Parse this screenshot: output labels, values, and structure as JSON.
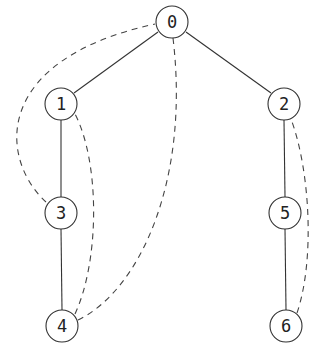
{
  "diagram": {
    "type": "tree-with-back-edges",
    "nodes": [
      {
        "id": "0",
        "label": "0",
        "x": 172,
        "y": 22
      },
      {
        "id": "1",
        "label": "1",
        "x": 61,
        "y": 104
      },
      {
        "id": "2",
        "label": "2",
        "x": 284,
        "y": 104
      },
      {
        "id": "3",
        "label": "3",
        "x": 61,
        "y": 213
      },
      {
        "id": "4",
        "label": "4",
        "x": 62,
        "y": 326
      },
      {
        "id": "5",
        "label": "5",
        "x": 285,
        "y": 213
      },
      {
        "id": "6",
        "label": "6",
        "x": 286,
        "y": 326
      }
    ],
    "tree_edges": [
      {
        "from": "0",
        "to": "1"
      },
      {
        "from": "0",
        "to": "2"
      },
      {
        "from": "1",
        "to": "3"
      },
      {
        "from": "3",
        "to": "4"
      },
      {
        "from": "2",
        "to": "5"
      },
      {
        "from": "5",
        "to": "6"
      }
    ],
    "back_edges": [
      {
        "from": "3",
        "to": "0",
        "style": "dashed"
      },
      {
        "from": "4",
        "to": "0",
        "style": "dashed"
      },
      {
        "from": "4",
        "to": "1",
        "style": "dashed"
      },
      {
        "from": "6",
        "to": "2",
        "style": "dashed"
      }
    ]
  }
}
